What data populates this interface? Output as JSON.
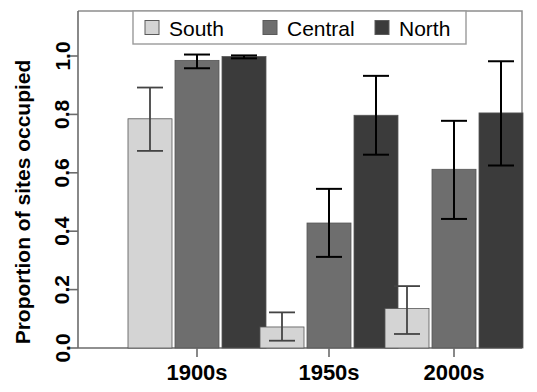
{
  "chart_data": {
    "type": "bar",
    "title": "",
    "subtitle": "",
    "xlabel": "",
    "ylabel": "Proportion of sites occupied",
    "categories": [
      "1900s",
      "1950s",
      "2000s"
    ],
    "ylim": [
      0.0,
      1.0
    ],
    "yticks": [
      "0.0",
      "0.2",
      "0.4",
      "0.6",
      "0.8",
      "1.0"
    ],
    "ytick_values": [
      0.0,
      0.2,
      0.4,
      0.6,
      0.8,
      1.0
    ],
    "grid": false,
    "legend_position": "top",
    "series": [
      {
        "name": "South",
        "color": "#d4d4d4",
        "values": [
          0.785,
          0.072,
          0.135
        ],
        "err_low": [
          0.675,
          0.025,
          0.048
        ],
        "err_high": [
          0.892,
          0.122,
          0.212
        ]
      },
      {
        "name": "Central",
        "color": "#6e6e6e",
        "values": [
          0.985,
          0.428,
          0.612
        ],
        "err_low": [
          0.958,
          0.312,
          0.442
        ],
        "err_high": [
          1.005,
          0.545,
          0.778
        ]
      },
      {
        "name": "North",
        "color": "#3b3b3b",
        "values": [
          0.998,
          0.797,
          0.805
        ],
        "err_low": [
          0.992,
          0.662,
          0.625
        ],
        "err_high": [
          1.002,
          0.932,
          0.982
        ]
      }
    ]
  },
  "legend": {
    "entries": [
      {
        "label": "South",
        "swatch": "#d4d4d4"
      },
      {
        "label": "Central",
        "swatch": "#6e6e6e"
      },
      {
        "label": "North",
        "swatch": "#3b3b3b"
      }
    ]
  },
  "axes": {
    "y_title": "Proportion of sites occupied",
    "y_ticks": [
      "0.0",
      "0.2",
      "0.4",
      "0.6",
      "0.8",
      "1.0"
    ],
    "x_ticks": [
      "1900s",
      "1950s",
      "2000s"
    ]
  }
}
